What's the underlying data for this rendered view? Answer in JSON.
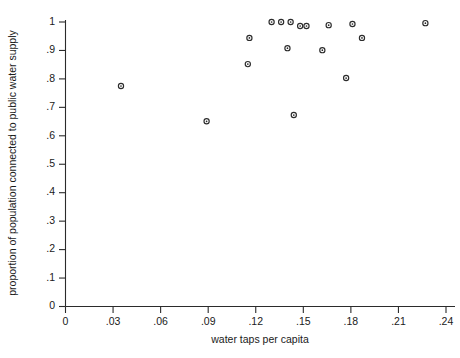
{
  "chart_data": {
    "type": "scatter",
    "title": "",
    "xlabel": "water taps per capita",
    "ylabel": "proportion of population connected to public water supply",
    "xlim": [
      0,
      0.245
    ],
    "ylim": [
      0,
      1.04
    ],
    "grid": false,
    "legend": null,
    "xticks": [
      0,
      0.03,
      0.06,
      0.09,
      0.12,
      0.15,
      0.18,
      0.21,
      0.24
    ],
    "xticklabels": [
      "0",
      ".03",
      ".06",
      ".09",
      ".12",
      ".15",
      ".18",
      ".21",
      ".24"
    ],
    "yticks": [
      0,
      0.1,
      0.2,
      0.3,
      0.4,
      0.5,
      0.6,
      0.7,
      0.8,
      0.9,
      1.0
    ],
    "yticklabels": [
      "0",
      ".1",
      ".2",
      ".3",
      ".4",
      ".5",
      ".6",
      ".7",
      ".8",
      ".9",
      "1"
    ],
    "marker": "circle-open",
    "marker_color": "#2b2b2b",
    "points": [
      {
        "x": 0.035,
        "y": 0.775
      },
      {
        "x": 0.089,
        "y": 0.651
      },
      {
        "x": 0.115,
        "y": 0.852
      },
      {
        "x": 0.116,
        "y": 0.944
      },
      {
        "x": 0.13,
        "y": 1.0
      },
      {
        "x": 0.136,
        "y": 1.0
      },
      {
        "x": 0.14,
        "y": 0.908
      },
      {
        "x": 0.142,
        "y": 1.0
      },
      {
        "x": 0.144,
        "y": 0.673
      },
      {
        "x": 0.148,
        "y": 0.986
      },
      {
        "x": 0.152,
        "y": 0.986
      },
      {
        "x": 0.162,
        "y": 0.901
      },
      {
        "x": 0.166,
        "y": 0.989
      },
      {
        "x": 0.177,
        "y": 0.803
      },
      {
        "x": 0.181,
        "y": 0.993
      },
      {
        "x": 0.187,
        "y": 0.944
      },
      {
        "x": 0.227,
        "y": 0.996
      }
    ]
  },
  "figure": {
    "xlabel": "water taps per capita",
    "ylabel": "proportion of population connected to public water supply"
  }
}
